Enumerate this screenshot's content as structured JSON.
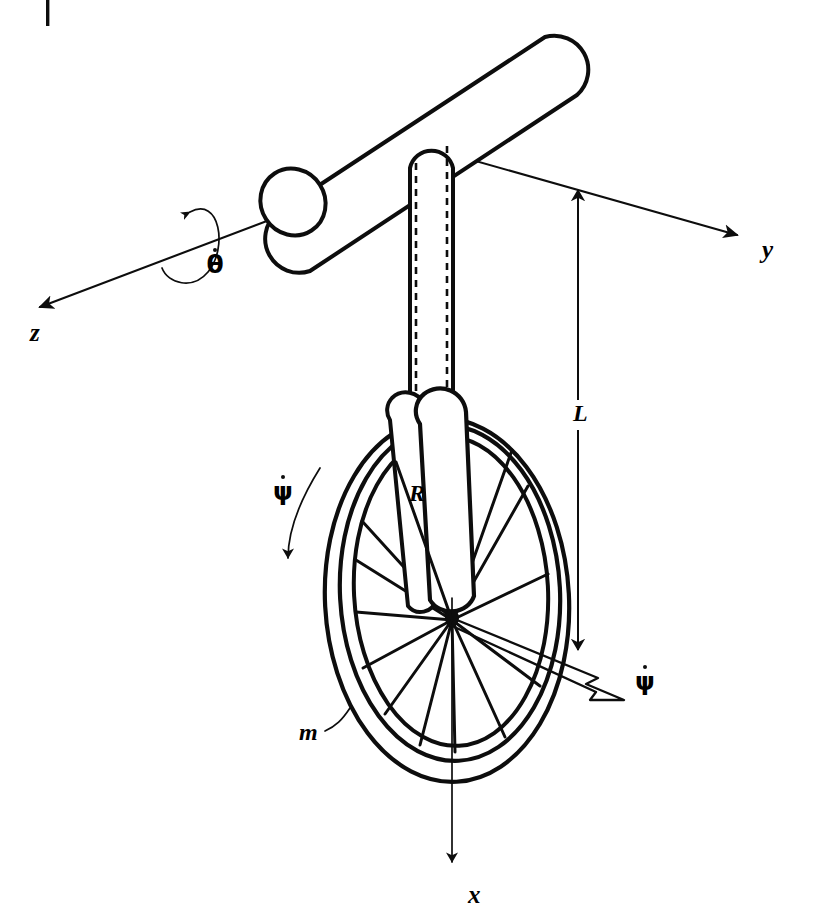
{
  "figure": {
    "kind": "mechanics-line-diagram",
    "background_color": "#ffffff",
    "ink_color": "#0d0d0d",
    "width": 824,
    "height": 924
  },
  "crop_mark": {
    "name": "page-trim-mark",
    "visible": true
  },
  "axes": [
    {
      "id": "z",
      "label": "z",
      "label_x": 38,
      "label_y": 334,
      "from_x": 468,
      "from_y": 145,
      "to_x": 33,
      "to_y": 310,
      "arrow_at": "to",
      "style": "thin"
    },
    {
      "id": "y",
      "label": "y",
      "label_x": 768,
      "label_y": 253,
      "from_x": 400,
      "from_y": 140,
      "to_x": 742,
      "to_y": 237,
      "arrow_at": "to",
      "style": "thin"
    },
    {
      "id": "x",
      "label": "x",
      "label_x": 474,
      "label_y": 898,
      "from_x": 452,
      "from_y": 600,
      "to_x": 452,
      "to_y": 872,
      "arrow_at": "to",
      "style": "thin"
    }
  ],
  "angular_rates": [
    {
      "id": "theta-dot",
      "symbol": "θ",
      "has_overdot": true,
      "label_x": 209,
      "label_y": 271,
      "arrow_kind": "curved-arc",
      "about_axis": "z",
      "description": "spin rate about the z axis"
    },
    {
      "id": "psi-dot-arc",
      "symbol": "ψ",
      "has_overdot": true,
      "label_x": 278,
      "label_y": 497,
      "arrow_kind": "curved-arc",
      "about_axis": "wheel",
      "description": "wheel rotation rate shown as curved arrow at left of wheel"
    },
    {
      "id": "psi-dot-vector",
      "symbol": "ψ",
      "has_overdot": true,
      "label_x": 640,
      "label_y": 690,
      "arrow_kind": "hollow-vector",
      "about_axis": "wheel-axle",
      "description": "wheel angular velocity vector along the axle, drawn hollow"
    }
  ],
  "dimensions": [
    {
      "id": "L",
      "label": "L",
      "label_x": 578,
      "label_y": 415,
      "kind": "linear-dimension",
      "from_x": 578,
      "from_y": 196,
      "to_x": 578,
      "to_y": 664,
      "description": "post length from handlebar joint down to wheel hub"
    },
    {
      "id": "R",
      "label": "R",
      "label_x": 416,
      "label_y": 498,
      "kind": "radius",
      "description": "wheel radius from hub to rim"
    },
    {
      "id": "m",
      "label": "m",
      "label_x": 308,
      "label_y": 737,
      "kind": "mass-callout",
      "leader_from_x": 327,
      "leader_from_y": 729,
      "leader_to_x": 348,
      "leader_to_y": 712,
      "description": "mass of the wheel, leader line to the tire"
    }
  ],
  "parts": [
    {
      "id": "handlebar",
      "name": "handlebar-cylinder",
      "description": "tilted capsule cylinder across the top"
    },
    {
      "id": "post",
      "name": "vertical-post",
      "description": "vertical seat post with dashed hidden edges"
    },
    {
      "id": "fork",
      "name": "wheel-fork",
      "description": "fork arms straddling the wheel down to the hub"
    },
    {
      "id": "tire",
      "name": "wheel-tire",
      "description": "outer double-line elliptical tire"
    },
    {
      "id": "rim",
      "name": "wheel-rim",
      "description": "inner elliptical rim"
    },
    {
      "id": "hub",
      "name": "wheel-hub",
      "description": "central hub where spokes converge"
    },
    {
      "id": "spokes",
      "name": "wheel-spokes",
      "count": 12,
      "description": "spokes radiating from hub to rim"
    }
  ]
}
